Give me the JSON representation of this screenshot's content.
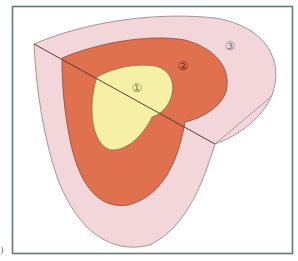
{
  "diagram": {
    "type": "nested-zones",
    "zones": [
      {
        "id": 1,
        "label": "①",
        "color": "#f6f0a6",
        "name": "inner-zone"
      },
      {
        "id": 2,
        "label": "②",
        "color": "#e0714f",
        "name": "middle-zone"
      },
      {
        "id": 3,
        "label": "③",
        "color": "#f3d6da",
        "name": "outer-zone"
      }
    ],
    "frame_color": "#5f7d74",
    "outline_color": "#8a6f6f",
    "divider_color": "#5a3a34"
  },
  "margin_mark": ")"
}
